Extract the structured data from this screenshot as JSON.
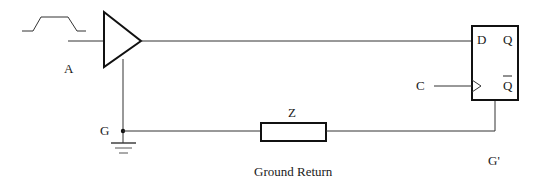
{
  "diagram": {
    "type": "circuit-schematic",
    "labels": {
      "input": "A",
      "clock": "C",
      "data_pin": "D",
      "q_pin": "Q",
      "qbar_pin": "Q",
      "ground_node": "G",
      "remote_ground_node": "G'",
      "impedance": "Z",
      "caption": "Ground Return"
    },
    "components": [
      {
        "id": "input-waveform",
        "kind": "pulse-waveform"
      },
      {
        "id": "buffer",
        "kind": "buffer-amplifier"
      },
      {
        "id": "flip-flop",
        "kind": "d-flip-flop",
        "pins": [
          "D",
          "Q",
          "C",
          "Q-bar"
        ]
      },
      {
        "id": "impedance",
        "kind": "resistor",
        "label": "Z"
      },
      {
        "id": "ground",
        "kind": "earth-ground"
      }
    ],
    "colors": {
      "line": "#333333",
      "background": "#ffffff",
      "text": "#1a1a1a"
    }
  }
}
